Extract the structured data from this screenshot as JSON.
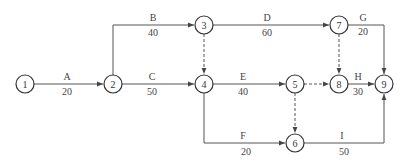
{
  "nodes": [
    {
      "id": "1",
      "x": 25,
      "y": 84
    },
    {
      "id": "2",
      "x": 113,
      "y": 84
    },
    {
      "id": "3",
      "x": 204,
      "y": 25
    },
    {
      "id": "4",
      "x": 204,
      "y": 84
    },
    {
      "id": "5",
      "x": 295,
      "y": 84
    },
    {
      "id": "6",
      "x": 295,
      "y": 143
    },
    {
      "id": "7",
      "x": 339,
      "y": 25
    },
    {
      "id": "8",
      "x": 339,
      "y": 84
    },
    {
      "id": "9",
      "x": 384,
      "y": 84
    }
  ],
  "activities": [
    {
      "name": "A",
      "duration": "20",
      "from": "1",
      "to": "2"
    },
    {
      "name": "B",
      "duration": "40",
      "from": "2",
      "to": "3"
    },
    {
      "name": "C",
      "duration": "50",
      "from": "2",
      "to": "4"
    },
    {
      "name": "D",
      "duration": "60",
      "from": "3",
      "to": "7"
    },
    {
      "name": "E",
      "duration": "40",
      "from": "4",
      "to": "5"
    },
    {
      "name": "F",
      "duration": "20",
      "from": "4",
      "to": "6"
    },
    {
      "name": "G",
      "duration": "20",
      "from": "7",
      "to": "9"
    },
    {
      "name": "H",
      "duration": "30",
      "from": "8",
      "to": "9"
    },
    {
      "name": "I",
      "duration": "50",
      "from": "6",
      "to": "9"
    }
  ],
  "dummies": [
    {
      "from": "3",
      "to": "4"
    },
    {
      "from": "5",
      "to": "8"
    },
    {
      "from": "5",
      "to": "6"
    },
    {
      "from": "7",
      "to": "8"
    }
  ]
}
